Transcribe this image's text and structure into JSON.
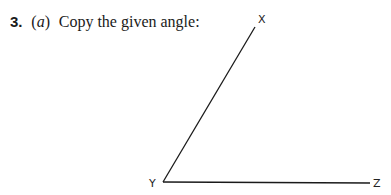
{
  "question": {
    "number": "3.",
    "part_open": "(",
    "part": "a",
    "part_close": ")",
    "text": "Copy the given angle:"
  },
  "figure": {
    "type": "angle",
    "vertex_label": "Y",
    "arm1_end_label": "X",
    "arm2_end_label": "Z",
    "line_color": "#1a1a1a"
  }
}
